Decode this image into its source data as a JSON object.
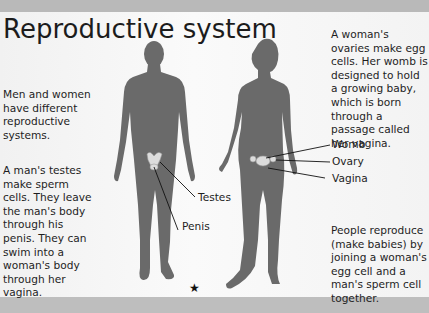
{
  "page": {
    "title": "Reproductive system",
    "intro_text": "Men and women have different reproductive systems.",
    "male_text": "A man's testes make sperm cells. They leave the man's body through his penis. They can swim into a woman's body through her vagina.",
    "female_text": "A woman's ovaries make egg cells. Her womb is designed to hold a growing baby, which is born through a passage called her vagina.",
    "people_text": "People reproduce (make babies) by joining a woman's egg cell and a man's sperm cell together.",
    "star_glyph": "★"
  },
  "labels": {
    "male": [
      "Testes",
      "Penis"
    ],
    "female": [
      "Womb",
      "Ovary",
      "Vagina"
    ]
  },
  "colors": {
    "silhouette": "#6b6b6b",
    "band": "#bdbdbd",
    "page": "#f6f6f6"
  }
}
